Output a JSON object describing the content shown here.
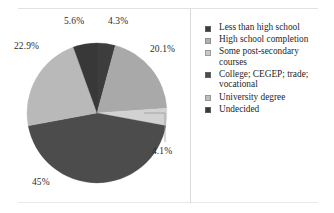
{
  "figure": {
    "title": "",
    "divider_color": "#d9d9d9",
    "background": "#ffffff"
  },
  "chart_data": {
    "type": "pie",
    "title": "",
    "xlabel": "",
    "ylabel": "",
    "legend_position": "right",
    "grid": false,
    "start_angle_deg": 0,
    "direction": "clockwise",
    "categories": [
      "Less than high school",
      "High school completion",
      "Some post-secondary courses",
      "College; CEGEP; trade; vocational",
      "University degree",
      "Undecided"
    ],
    "values": [
      4.3,
      20.1,
      4.1,
      45,
      22.9,
      5.6
    ],
    "labels": [
      "4.3%",
      "20.1%",
      "4.1%",
      "45%",
      "22.9%",
      "5.6%"
    ],
    "colors": [
      "#3d3d3d",
      "#a9a9a9",
      "#d2d2d2",
      "#4c4c4c",
      "#b9b9b9",
      "#383838"
    ],
    "units": "percent"
  },
  "slice_labels": {
    "less_than_high_school": "4.3%",
    "high_school_completion": "20.1%",
    "some_post_secondary": "4.1%",
    "college_cegep_trade": "45%",
    "university_degree": "22.9%",
    "undecided": "5.6%"
  },
  "legend": {
    "items": [
      {
        "label": "Less than high school",
        "color": "#3d3d3d",
        "wrapped": false
      },
      {
        "label": "High school completion",
        "color": "#b0b0b0",
        "wrapped": true
      },
      {
        "label": "Some post-secondary courses",
        "color": "#c9c9c9",
        "wrapped": true
      },
      {
        "label": "College; CEGEP; trade; vocational",
        "color": "#4c4c4c",
        "wrapped": true
      },
      {
        "label": "University degree",
        "color": "#bdbdbd",
        "wrapped": false
      },
      {
        "label": "Undecided",
        "color": "#3a3a3a",
        "wrapped": false
      }
    ]
  }
}
